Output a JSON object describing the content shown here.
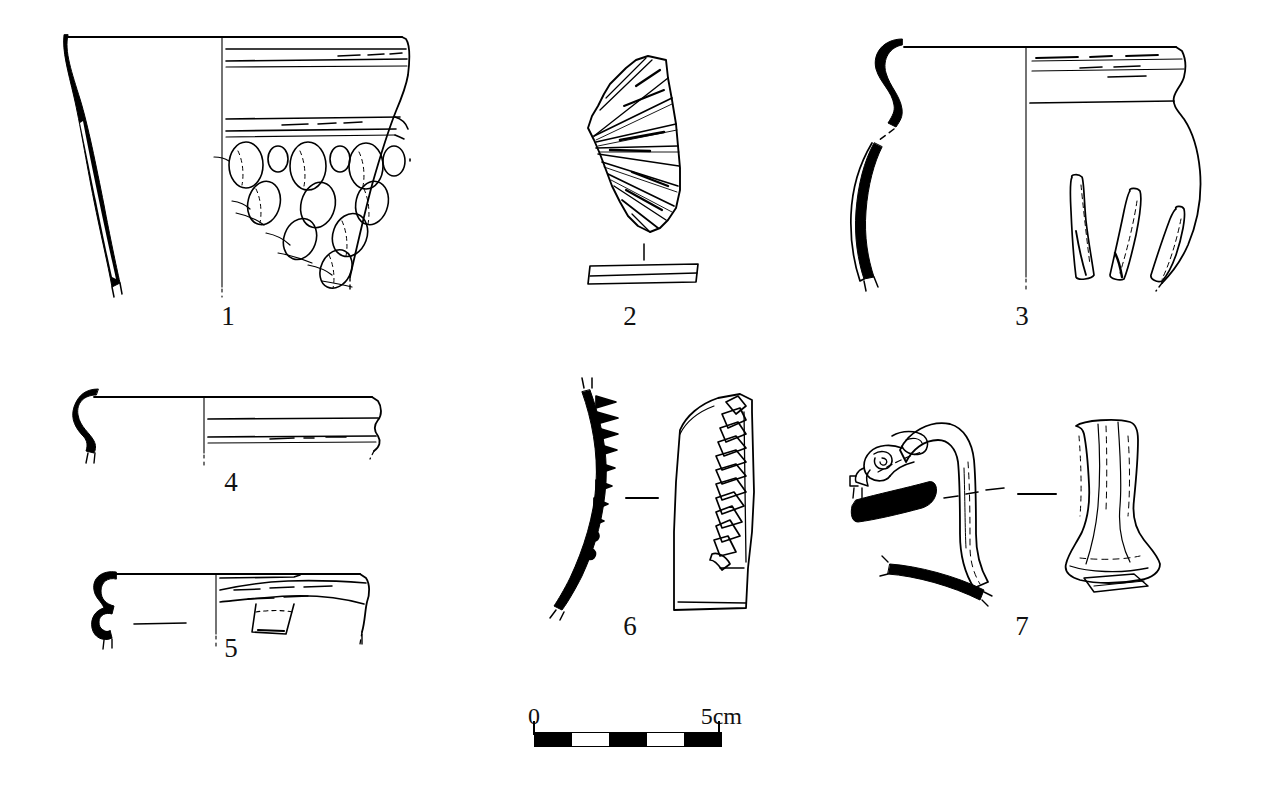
{
  "plate": {
    "title": "Archaeological pottery illustration plate",
    "description": "Line drawings of seven prehistoric ceramic vessels and sherds, each shown as a black-filled section profile on the left and an exterior elevation on the right, with an accompanying graphic scale bar.",
    "background_color": "#ffffff",
    "ink_color": "#000000",
    "object_count": 7
  },
  "objects": [
    {
      "id": "1",
      "label": "1",
      "name": "decorated-beaker-rim",
      "description": "Large open vessel with flaring rim; section profile at left shown solid black, exterior at right with two grooved cordon bands below the rim and rows of applied oval bosses arranged in a descending scale pattern.",
      "views": [
        "section",
        "exterior"
      ],
      "decoration": "grooved horizontal bands and oval applied bosses"
    },
    {
      "id": "2",
      "label": "2",
      "name": "fan-grooved-sherd",
      "description": "Fan-shaped body sherd with radiating grooved flutes; a separate narrow strip below shows the sherd edge profile.",
      "views": [
        "exterior",
        "edge-profile"
      ],
      "decoration": "radial grooved fluting"
    },
    {
      "id": "3",
      "label": "3",
      "name": "globular-jar",
      "description": "Globular jar with everted rim and short neck; section profile at left shown solid black, exterior at right with grooved neck lines and three applied vertical ribs on the shoulder.",
      "views": [
        "section",
        "exterior"
      ],
      "decoration": "neck grooves and three vertical applied ribs"
    },
    {
      "id": "4",
      "label": "4",
      "name": "hooked-rim-sherd",
      "description": "Thin-walled rim sherd with small rolled and hooked rim; black section at left, exterior at right with two parallel horizontal grooves.",
      "views": [
        "section",
        "exterior"
      ],
      "decoration": "two parallel horizontal grooves"
    },
    {
      "id": "5",
      "label": "5",
      "name": "lugged-rim-sherd",
      "description": "Rim sherd with double-rolled figure-of-eight section at left and an exterior view at right showing a horizontally pierced applied lug beneath the rim.",
      "views": [
        "section",
        "exterior"
      ],
      "decoration": "applied perforated lug"
    },
    {
      "id": "6",
      "label": "6",
      "name": "ridged-body-sherd",
      "description": "Curved body sherd; black section at left showing the projecting applied ridge in profile, exterior at right with a vertical applied cordon bearing triangular finger-impressed notches.",
      "views": [
        "section",
        "exterior"
      ],
      "decoration": "vertical applied cordon with triangular impressions"
    },
    {
      "id": "7",
      "label": "7",
      "name": "zoomorphic-handle",
      "description": "Strap handle with a scrolled zoomorphic (animal-head) terminal; section profile at left with black-filled vessel wall fragments, plan elevation at right showing the flared lower attachment.",
      "views": [
        "section",
        "elevation"
      ],
      "decoration": "scrolled zoomorphic terminal"
    }
  ],
  "scale": {
    "name": "graphic-scale-bar",
    "start_label": "0",
    "end_label": "5cm",
    "total_cm": 5,
    "segment_count": 5,
    "segment_cm": 1,
    "segment_pattern": [
      "dark",
      "light",
      "dark",
      "light",
      "dark"
    ]
  }
}
